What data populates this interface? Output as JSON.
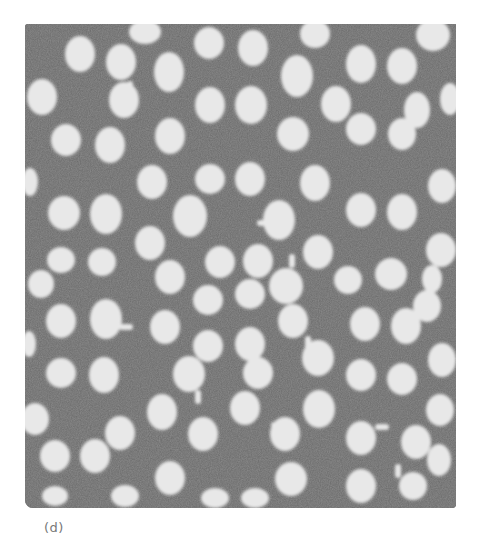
{
  "figure": {
    "panel_label": "(d)",
    "colors": {
      "background_matrix": "#6e6e6e",
      "particle": "#e9e9e9",
      "label": "#777777",
      "page": "#ffffff"
    }
  }
}
